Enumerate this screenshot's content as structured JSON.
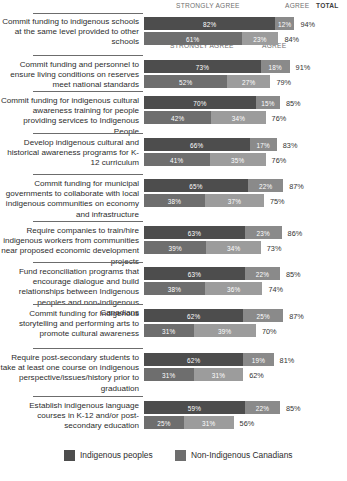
{
  "header": {
    "strongly_agree": "STRONGLY AGREE",
    "agree": "AGREE",
    "total": "TOTAL",
    "sub_strongly_agree": "STRONGLY AGREE",
    "sub_agree": "AGREE"
  },
  "legend": {
    "items": [
      {
        "label": "Indigenous peoples",
        "color": "#4d4d4d"
      },
      {
        "label": "Non-Indigenous Canadians",
        "color": "#6e6e6e"
      }
    ]
  },
  "colors": {
    "strongly_agree_indigenous": "#4d4d4d",
    "agree_indigenous": "#8a8a8a",
    "strongly_agree_non_indigenous": "#6e6e6e",
    "agree_non_indigenous": "#9c9c9c",
    "track": "#e3e3e3",
    "rule": "#6c6c6c"
  },
  "chart_data": {
    "type": "bar",
    "orientation": "horizontal",
    "stacked": true,
    "title": "",
    "xlabel": "",
    "ylabel": "",
    "xlim": [
      0,
      100
    ],
    "grid": false,
    "legend_position": "bottom",
    "segment_labels": [
      "STRONGLY AGREE",
      "AGREE"
    ],
    "series": [
      {
        "name": "Indigenous peoples",
        "color": "#4d4d4d"
      },
      {
        "name": "Non-Indigenous Canadians",
        "color": "#6e6e6e"
      }
    ],
    "rows": [
      {
        "category": "Commit funding to indigenous schools at the same level provided to other schools",
        "bars": [
          {
            "group": "Indigenous peoples",
            "strongly_agree": 82,
            "agree": 12,
            "total": 94,
            "strongly_agree_label": "82%",
            "agree_label": "12%",
            "total_label": "94%"
          },
          {
            "group": "Non-Indigenous Canadians",
            "strongly_agree": 61,
            "agree": 23,
            "total": 84,
            "strongly_agree_label": "61%",
            "agree_label": "23%",
            "total_label": "84%"
          }
        ]
      },
      {
        "category": "Commit funding and personnel to ensure living conditions on reserves meet national standards",
        "bars": [
          {
            "group": "Indigenous peoples",
            "strongly_agree": 73,
            "agree": 18,
            "total": 91,
            "strongly_agree_label": "73%",
            "agree_label": "18%",
            "total_label": "91%"
          },
          {
            "group": "Non-Indigenous Canadians",
            "strongly_agree": 52,
            "agree": 27,
            "total": 79,
            "strongly_agree_label": "52%",
            "agree_label": "27%",
            "total_label": "79%"
          }
        ]
      },
      {
        "category": "Commit funding for indigenous cultural awareness training for people providing services to Indigenous People",
        "bars": [
          {
            "group": "Indigenous peoples",
            "strongly_agree": 70,
            "agree": 15,
            "total": 85,
            "strongly_agree_label": "70%",
            "agree_label": "15%",
            "total_label": "85%"
          },
          {
            "group": "Non-Indigenous Canadians",
            "strongly_agree": 42,
            "agree": 34,
            "total": 76,
            "strongly_agree_label": "42%",
            "agree_label": "34%",
            "total_label": "76%"
          }
        ]
      },
      {
        "category": "Develop indigenous cultural and historical awareness programs for K-12 curriculum",
        "bars": [
          {
            "group": "Indigenous peoples",
            "strongly_agree": 66,
            "agree": 17,
            "total": 83,
            "strongly_agree_label": "66%",
            "agree_label": "17%",
            "total_label": "83%"
          },
          {
            "group": "Non-Indigenous Canadians",
            "strongly_agree": 41,
            "agree": 35,
            "total": 76,
            "strongly_agree_label": "41%",
            "agree_label": "35%",
            "total_label": "76%"
          }
        ]
      },
      {
        "category": "Commit funding for municipal governments to collaborate with local indigenous communities on economy and infrastructure",
        "bars": [
          {
            "group": "Indigenous peoples",
            "strongly_agree": 65,
            "agree": 22,
            "total": 87,
            "strongly_agree_label": "65%",
            "agree_label": "22%",
            "total_label": "87%"
          },
          {
            "group": "Non-Indigenous Canadians",
            "strongly_agree": 38,
            "agree": 37,
            "total": 75,
            "strongly_agree_label": "38%",
            "agree_label": "37%",
            "total_label": "75%"
          }
        ]
      },
      {
        "category": "Require companies to train/hire indigenous workers from communities near proposed economic development projects",
        "bars": [
          {
            "group": "Indigenous peoples",
            "strongly_agree": 63,
            "agree": 23,
            "total": 86,
            "strongly_agree_label": "63%",
            "agree_label": "23%",
            "total_label": "86%"
          },
          {
            "group": "Non-Indigenous Canadians",
            "strongly_agree": 39,
            "agree": 34,
            "total": 73,
            "strongly_agree_label": "39%",
            "agree_label": "34%",
            "total_label": "73%"
          }
        ]
      },
      {
        "category": "Fund reconciliation programs that encourage dialogue and build relationships between Indigenous peoples and non-indigenous Canadians",
        "bars": [
          {
            "group": "Indigenous peoples",
            "strongly_agree": 63,
            "agree": 22,
            "total": 85,
            "strongly_agree_label": "63%",
            "agree_label": "22%",
            "total_label": "85%"
          },
          {
            "group": "Non-Indigenous Canadians",
            "strongly_agree": 38,
            "agree": 36,
            "total": 74,
            "strongly_agree_label": "38%",
            "agree_label": "36%",
            "total_label": "74%"
          }
        ]
      },
      {
        "category": "Commit funding for indigenous storytelling and performing arts to promote cultural awareness",
        "bars": [
          {
            "group": "Indigenous peoples",
            "strongly_agree": 62,
            "agree": 25,
            "total": 87,
            "strongly_agree_label": "62%",
            "agree_label": "25%",
            "total_label": "87%"
          },
          {
            "group": "Non-Indigenous Canadians",
            "strongly_agree": 31,
            "agree": 39,
            "total": 70,
            "strongly_agree_label": "31%",
            "agree_label": "39%",
            "total_label": "70%"
          }
        ]
      },
      {
        "category": "Require post-secondary students to take at least one course on indigenous perspective/issues/history prior to graduation",
        "bars": [
          {
            "group": "Indigenous peoples",
            "strongly_agree": 62,
            "agree": 19,
            "total": 81,
            "strongly_agree_label": "62%",
            "agree_label": "19%",
            "total_label": "81%"
          },
          {
            "group": "Non-Indigenous Canadians",
            "strongly_agree": 31,
            "agree": 31,
            "total": 62,
            "strongly_agree_label": "31%",
            "agree_label": "31%",
            "total_label": "62%"
          }
        ]
      },
      {
        "category": "Establish indigenous language courses in K-12 and/or post-secondary education",
        "bars": [
          {
            "group": "Indigenous peoples",
            "strongly_agree": 63,
            "agree": 22,
            "total": 85,
            "strongly_agree_label": "59%",
            "agree_label": "22%",
            "total_label": "85%"
          },
          {
            "group": "Non-Indigenous Canadians",
            "strongly_agree": 25,
            "agree": 31,
            "total": 56,
            "strongly_agree_label": "25%",
            "agree_label": "31%",
            "total_label": "56%"
          }
        ]
      }
    ]
  }
}
